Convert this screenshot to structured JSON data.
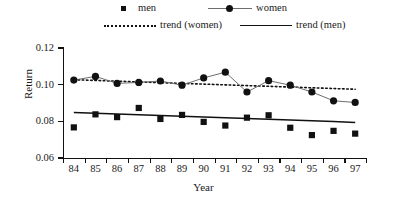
{
  "chart_data": {
    "type": "line",
    "title": "",
    "xlabel": "Year",
    "ylabel": "Return",
    "categories": [
      "84",
      "85",
      "86",
      "87",
      "88",
      "89",
      "90",
      "91",
      "92",
      "93",
      "94",
      "95",
      "96",
      "97"
    ],
    "x": [
      84,
      85,
      86,
      87,
      88,
      89,
      90,
      91,
      92,
      93,
      94,
      95,
      96,
      97
    ],
    "ylim": [
      0.06,
      0.12
    ],
    "ytick_labels": [
      "0.06",
      "0.08",
      "0.10",
      "0.12"
    ],
    "ytick_values": [
      0.06,
      0.08,
      0.1,
      0.12
    ],
    "grid": false,
    "legend_position": "top",
    "series": [
      {
        "name": "men",
        "marker": "square",
        "line": "none",
        "values": [
          0.0767,
          0.0838,
          0.0823,
          0.0873,
          0.0813,
          0.0835,
          0.0797,
          0.0777,
          0.082,
          0.0833,
          0.0765,
          0.0725,
          0.0748,
          0.0733
        ]
      },
      {
        "name": "women",
        "marker": "circle",
        "line": "solid-thin",
        "values": [
          0.1025,
          0.1045,
          0.1007,
          0.1012,
          0.102,
          0.0997,
          0.1037,
          0.1068,
          0.096,
          0.1022,
          0.0997,
          0.096,
          0.0912,
          0.0903
        ]
      },
      {
        "name": "trend (women)",
        "marker": "none",
        "line": "dotted",
        "values": [
          0.1027,
          0.1023,
          0.1019,
          0.1015,
          0.1011,
          0.1007,
          0.1003,
          0.0999,
          0.0995,
          0.0991,
          0.0987,
          0.0983,
          0.0979,
          0.0975
        ]
      },
      {
        "name": "trend (men)",
        "marker": "none",
        "line": "solid",
        "values": [
          0.0848,
          0.0844,
          0.084,
          0.0836,
          0.0832,
          0.0828,
          0.0824,
          0.0819,
          0.0815,
          0.0811,
          0.0807,
          0.0803,
          0.0799,
          0.0794
        ]
      }
    ]
  },
  "legend": {
    "items": [
      {
        "label": "men",
        "symbol": "square-marker"
      },
      {
        "label": "women",
        "symbol": "circle-marker-line"
      },
      {
        "label": "trend (women)",
        "symbol": "dotted-line"
      },
      {
        "label": "trend (men)",
        "symbol": "solid-line"
      }
    ]
  },
  "axes": {
    "y_title": "Return",
    "x_title": "Year"
  },
  "colors": {
    "marker": "#111111",
    "women_line": "#6e6e6e",
    "trend": "#111111",
    "axis": "#111111",
    "background": "#ffffff"
  }
}
